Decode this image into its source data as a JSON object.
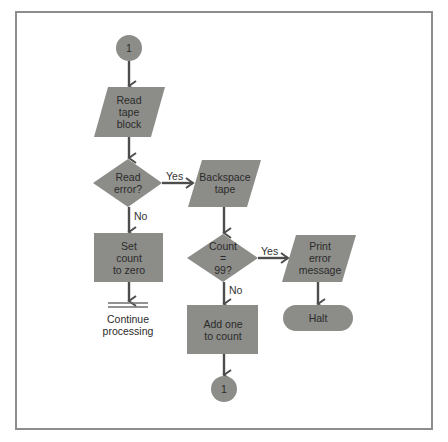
{
  "diagram": {
    "type": "flowchart",
    "colors": {
      "shape_fill": "#8c8c88",
      "line": "#4d4d4d",
      "frame": "#8d8d8d",
      "text": "#2b2b2b",
      "background": "#ffffff"
    },
    "nodes": [
      {
        "id": "start_connector",
        "shape": "circle",
        "label": "1"
      },
      {
        "id": "read_tape_block",
        "shape": "parallelogram",
        "label": "Read\ntape\nblock"
      },
      {
        "id": "read_error",
        "shape": "diamond",
        "label": "Read\nerror?"
      },
      {
        "id": "backspace_tape",
        "shape": "parallelogram",
        "label": "Backspace\ntape"
      },
      {
        "id": "set_count_zero",
        "shape": "rectangle",
        "label": "Set\ncount\nto zero"
      },
      {
        "id": "continue_processing",
        "shape": "double-line",
        "label": "Continue\nprocessing"
      },
      {
        "id": "count_99",
        "shape": "diamond",
        "label": "Count\n=\n99?"
      },
      {
        "id": "print_error",
        "shape": "parallelogram",
        "label": "Print\nerror\nmessage"
      },
      {
        "id": "halt",
        "shape": "terminal",
        "label": "Halt"
      },
      {
        "id": "add_one",
        "shape": "rectangle",
        "label": "Add one\nto count"
      },
      {
        "id": "end_connector",
        "shape": "circle",
        "label": "1"
      }
    ],
    "edges": [
      {
        "from": "start_connector",
        "to": "read_tape_block",
        "label": ""
      },
      {
        "from": "read_tape_block",
        "to": "read_error",
        "label": ""
      },
      {
        "from": "read_error",
        "to": "backspace_tape",
        "label": "Yes"
      },
      {
        "from": "read_error",
        "to": "set_count_zero",
        "label": "No"
      },
      {
        "from": "set_count_zero",
        "to": "continue_processing",
        "label": ""
      },
      {
        "from": "backspace_tape",
        "to": "count_99",
        "label": ""
      },
      {
        "from": "count_99",
        "to": "print_error",
        "label": "Yes"
      },
      {
        "from": "count_99",
        "to": "add_one",
        "label": "No"
      },
      {
        "from": "print_error",
        "to": "halt",
        "label": ""
      },
      {
        "from": "add_one",
        "to": "end_connector",
        "label": ""
      }
    ],
    "edge_labels": {
      "read_error_yes": "Yes",
      "read_error_no": "No",
      "count_yes": "Yes",
      "count_no": "No"
    }
  }
}
